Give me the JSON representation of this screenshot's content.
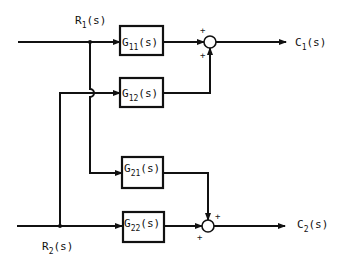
{
  "diagram": {
    "type": "block-diagram",
    "inputs": [
      {
        "id": "R1",
        "base": "R",
        "sub": "1",
        "suffix": "(s)"
      },
      {
        "id": "R2",
        "base": "R",
        "sub": "2",
        "suffix": "(s)"
      }
    ],
    "outputs": [
      {
        "id": "C1",
        "base": "C",
        "sub": "1",
        "suffix": "(s)"
      },
      {
        "id": "C2",
        "base": "C",
        "sub": "2",
        "suffix": "(s)"
      }
    ],
    "blocks": [
      {
        "id": "G11",
        "base": "G",
        "sub": "11",
        "suffix": "(s)"
      },
      {
        "id": "G12",
        "base": "G",
        "sub": "12",
        "suffix": "(s)"
      },
      {
        "id": "G21",
        "base": "G",
        "sub": "21",
        "suffix": "(s)"
      },
      {
        "id": "G22",
        "base": "G",
        "sub": "22",
        "suffix": "(s)"
      }
    ],
    "summing_junctions": [
      {
        "id": "S1",
        "signs": [
          "+",
          "+"
        ],
        "output": "C1"
      },
      {
        "id": "S2",
        "signs": [
          "+",
          "+"
        ],
        "output": "C2"
      }
    ],
    "connections": [
      "R1 -> G11",
      "R1 -> G21",
      "R2 -> G12",
      "R2 -> G22",
      "G11 -> S1",
      "G12 -> S1",
      "S1 -> C1",
      "G21 -> S2",
      "G22 -> S2",
      "S2 -> C2"
    ]
  }
}
